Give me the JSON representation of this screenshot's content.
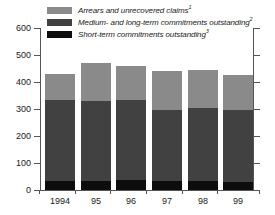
{
  "chart_data": {
    "type": "bar",
    "stacked": true,
    "title": "",
    "xlabel": "",
    "ylabel": "",
    "categories": [
      "1994",
      "95",
      "96",
      "97",
      "98",
      "99"
    ],
    "ylim": [
      0,
      600
    ],
    "yticks": [
      0,
      100,
      200,
      300,
      400,
      500,
      600
    ],
    "ytick_labels": [
      "0",
      "100",
      "200",
      "300",
      "400",
      "500",
      "600"
    ],
    "grid": false,
    "legend_position": "top",
    "series": [
      {
        "name": "Short-term commitments outstanding",
        "footnote": "3",
        "color": "#0d0d0d",
        "values": [
          34,
          34,
          38,
          34,
          34,
          30
        ]
      },
      {
        "name": "Medium- and long-term commitments outstanding",
        "footnote": "2",
        "color": "#414141",
        "values": [
          301,
          294,
          294,
          264,
          271,
          265
        ]
      },
      {
        "name": "Arrears and unrecovered claims",
        "footnote": "1",
        "color": "#8a8a8a",
        "values": [
          95,
          142,
          128,
          142,
          140,
          130
        ]
      }
    ],
    "totals": [
      430,
      470,
      460,
      440,
      445,
      425
    ]
  },
  "legend": {
    "items": [
      {
        "label": "Arrears and unrecovered claims",
        "footnote": "1",
        "color": "#8a8a8a"
      },
      {
        "label": "Medium- and long-term commitments outstanding",
        "footnote": "2",
        "color": "#414141"
      },
      {
        "label": "Short-term commitments outstanding",
        "footnote": "3",
        "color": "#0d0d0d"
      }
    ]
  }
}
